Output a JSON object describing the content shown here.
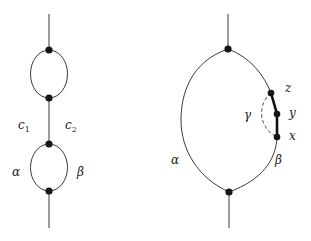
{
  "figure": {
    "left": {
      "labels": {
        "c1": "c",
        "c1_sub": "1",
        "c2": "c",
        "c2_sub": "2",
        "alpha": "α",
        "beta": "β"
      }
    },
    "right": {
      "labels": {
        "alpha": "α",
        "beta": "β",
        "gamma": "γ",
        "x": "x",
        "y": "y",
        "z": "z"
      }
    },
    "colors": {
      "edge": "#3a3a3a",
      "node": "#161616",
      "background": "#ffffff"
    }
  }
}
